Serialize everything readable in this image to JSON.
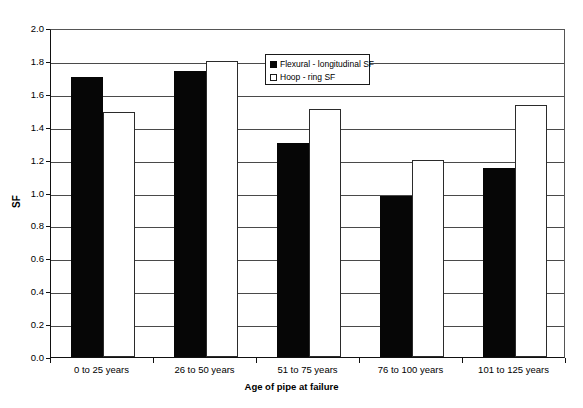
{
  "chart_data": {
    "type": "bar",
    "title": "",
    "xlabel": "Age of pipe at failure",
    "ylabel": "SF",
    "categories": [
      "0 to 25 years",
      "26 to 50 years",
      "51 to 75 years",
      "76 to 100 years",
      "101 to 125 years"
    ],
    "series": [
      {
        "name": "Flexural - longitudinal SF",
        "color": "#060606",
        "fill": "solid-black",
        "values": [
          1.7,
          1.74,
          1.3,
          0.98,
          1.15
        ]
      },
      {
        "name": "Hoop - ring SF",
        "color": "#ffffff",
        "fill": "white-outline",
        "values": [
          1.49,
          1.8,
          1.51,
          1.2,
          1.53
        ]
      }
    ],
    "ylim": [
      0.0,
      2.0
    ],
    "ytick_step": 0.2,
    "yticks": [
      "0.0",
      "0.2",
      "0.4",
      "0.6",
      "0.8",
      "1.0",
      "1.2",
      "1.4",
      "1.6",
      "1.8",
      "2.0"
    ],
    "grid": "horizontal",
    "legend_position": "top-center-inside",
    "legend_entries": [
      "Flexural - longitudinal SF",
      "Hoop - ring SF"
    ]
  }
}
